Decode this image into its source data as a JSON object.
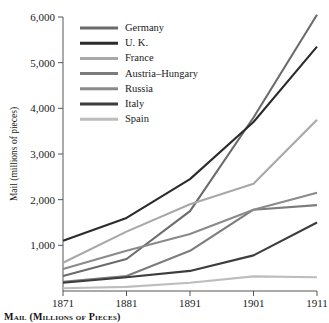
{
  "chart_data": {
    "type": "line",
    "title": "",
    "xlabel": "",
    "ylabel": "Mail (millions of pieces)",
    "x": [
      1871,
      1881,
      1891,
      1901,
      1911
    ],
    "xtick_labels": [
      "1871",
      "1881",
      "1891",
      "1901",
      "1911"
    ],
    "ytick_labels": [
      "1,000",
      "2,000",
      "3,000",
      "4,000",
      "5,000",
      "6,000"
    ],
    "yticks": [
      1000,
      2000,
      3000,
      4000,
      5000,
      6000
    ],
    "ylim": [
      0,
      6000
    ],
    "grid": false,
    "legend_position": "upper-left-inside",
    "series": [
      {
        "name": "Germany",
        "values": [
          330,
          700,
          1750,
          3800,
          6050
        ],
        "color": "#6b6b6b"
      },
      {
        "name": "U. K.",
        "values": [
          1100,
          1600,
          2450,
          3700,
          5350
        ],
        "color": "#2b2b2b"
      },
      {
        "name": "France",
        "values": [
          620,
          1300,
          1900,
          2350,
          3750
        ],
        "color": "#a8a8a8"
      },
      {
        "name": "Austria–Hungary",
        "values": [
          200,
          330,
          880,
          1780,
          1880
        ],
        "color": "#7c7c7c"
      },
      {
        "name": "Russia",
        "values": [
          480,
          880,
          1250,
          1780,
          2150
        ],
        "color": "#8a8a8a"
      },
      {
        "name": "Italy",
        "values": [
          180,
          300,
          440,
          780,
          1500
        ],
        "color": "#3d3d3d"
      },
      {
        "name": "Spain",
        "values": [
          60,
          90,
          180,
          320,
          300
        ],
        "color": "#bdbdbd"
      }
    ]
  },
  "caption": {
    "text": "Mail (Millions of Pieces)"
  },
  "axis": {
    "y_title": "Mail (millions of pieces)"
  }
}
